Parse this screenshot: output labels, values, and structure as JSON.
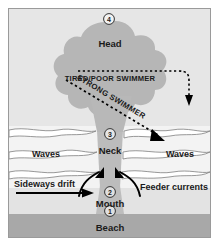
{
  "figure": {
    "frame": {
      "border_color": "#9a9a9a",
      "background_color": "#e8e8e8"
    }
  },
  "colors": {
    "water": "#e4e4e4",
    "water_light": "#efefef",
    "rip_gray": "#b8b8b8",
    "rip_gray_dark": "#b0b0b0",
    "beach": "#a8a8a8",
    "wave_line": "#ffffff",
    "wave_stroke": "#8d8d8d",
    "text": "#1a1a1a",
    "arrow": "#000000"
  },
  "zones": {
    "beach": {
      "label": "Beach",
      "marker": "1"
    },
    "mouth": {
      "label": "Mouth",
      "marker": "2"
    },
    "neck": {
      "label": "Neck",
      "marker": "3"
    },
    "head": {
      "label": "Head",
      "marker": "4"
    }
  },
  "water_labels": {
    "waves_left": "Waves",
    "waves_right": "Waves"
  },
  "currents": {
    "sideways_drift": "Sideways drift",
    "feeder_currents": "Feeder currents"
  },
  "swimmer_paths": {
    "tired": "TIRED/POOR SWIMMER",
    "strong": "STRONG SWIMMER"
  },
  "markers": [
    "1",
    "2",
    "3",
    "4"
  ]
}
